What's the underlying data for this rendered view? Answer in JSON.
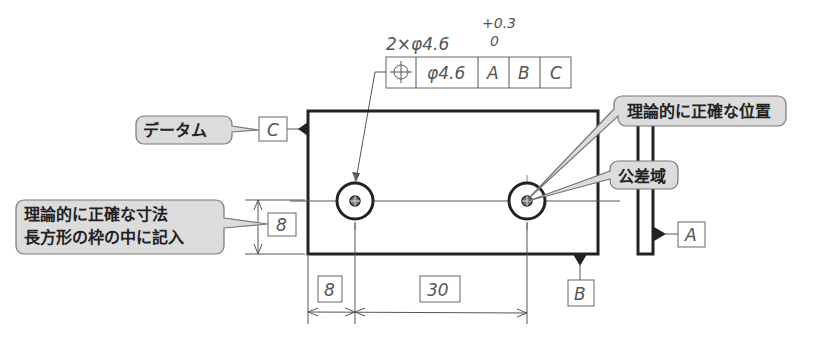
{
  "feature_control": {
    "quantity_label": "2×φ4.6",
    "tolerance_upper": "+0.3",
    "tolerance_lower": "0",
    "symbol": "position",
    "tolerance_value": "φ4.6",
    "datums": [
      "A",
      "B",
      "C"
    ]
  },
  "callouts": {
    "datum": "データム",
    "true_position": "理論的に正確な位置",
    "tolerance_zone": "公差域",
    "basic_dimension_line1": "理論的に正確な寸法",
    "basic_dimension_line2": "長方形の枠の中に記入"
  },
  "datum_labels": {
    "left": "C",
    "bottom": "B",
    "side": "A"
  },
  "dimensions": {
    "vertical": "8",
    "horizontal_left": "8",
    "horizontal_spacing": "30"
  },
  "colors": {
    "outline": "#222222",
    "thin_line": "#555555",
    "callout_fill": "#dcdcdc"
  }
}
